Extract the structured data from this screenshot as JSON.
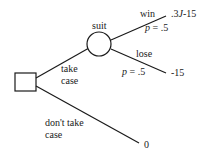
{
  "diagram": {
    "type": "decision-tree",
    "decision_node": {
      "shape": "square"
    },
    "chance_node": {
      "shape": "circle",
      "label": "suit"
    },
    "branches": {
      "take_case": {
        "label_line1": "take",
        "label_line2": "case"
      },
      "dont_take_case": {
        "label_line1": "don't take",
        "label_line2": "case",
        "payoff": "0"
      },
      "win": {
        "label": "win",
        "prob_var": "p",
        "prob_eq": " = .5",
        "payoff_prefix": ".3",
        "payoff_var": "J",
        "payoff_suffix": "-15"
      },
      "lose": {
        "label": "lose",
        "prob_var": "p",
        "prob_eq": " = .5",
        "payoff": "-15"
      }
    },
    "colors": {
      "line": "#1a1a1a",
      "background": "#ffffff"
    }
  }
}
